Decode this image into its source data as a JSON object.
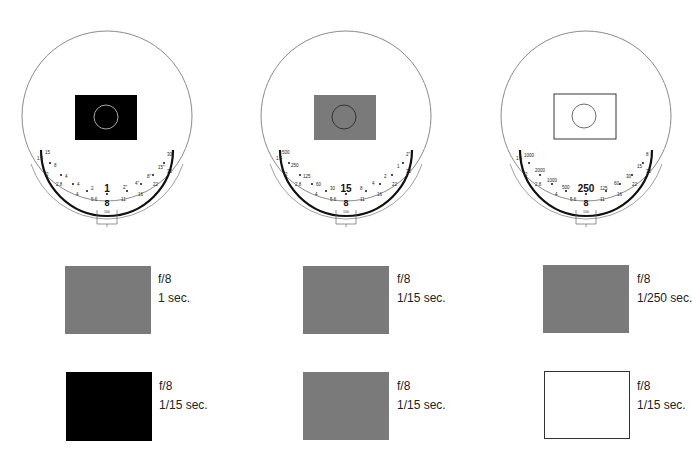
{
  "dials": [
    {
      "id": "dial-1",
      "center_box_fill": "#000000",
      "center_box_stroke": "#000000",
      "center_circle_stroke": "#cfcfcf",
      "shutter_value": "1",
      "aperture_value": "8",
      "iso_value": "100",
      "outer_scale": [
        "15",
        "8",
        "4",
        "2",
        "1",
        "2\"",
        "4\"",
        "8\"",
        "15\"",
        "30\""
      ],
      "inner_scale": [
        "1.4",
        "2",
        "2.8",
        "4",
        "5.6",
        "11",
        "16",
        "22",
        "32"
      ]
    },
    {
      "id": "dial-2",
      "center_box_fill": "#7a7a7a",
      "center_box_stroke": "#7a7a7a",
      "center_circle_stroke": "#222222",
      "shutter_value": "15",
      "aperture_value": "8",
      "iso_value": "100",
      "outer_scale": [
        "500",
        "250",
        "125",
        "60",
        "30",
        "15",
        "8",
        "4",
        "2",
        "1",
        "2\""
      ],
      "inner_scale": [
        "1.4",
        "2",
        "2.8",
        "4",
        "5.6",
        "11",
        "16",
        "22",
        "32"
      ]
    },
    {
      "id": "dial-3",
      "center_box_fill": "#ffffff",
      "center_box_stroke": "#222222",
      "center_circle_stroke": "#444444",
      "shutter_value": "250",
      "aperture_value": "8",
      "iso_value": "100",
      "outer_scale": [
        "1000",
        "2000",
        "1000",
        "500",
        "250",
        "125",
        "60",
        "30",
        "15",
        "8"
      ],
      "inner_scale": [
        "1.4",
        "2",
        "2.8",
        "4",
        "5.6",
        "11",
        "16",
        "22",
        "32"
      ]
    }
  ],
  "results": [
    {
      "row": 1,
      "col": 1,
      "fill": "#7a7a7a",
      "stroke": "#7a7a7a",
      "aperture": "f/8",
      "shutter": "1 sec."
    },
    {
      "row": 1,
      "col": 2,
      "fill": "#7a7a7a",
      "stroke": "#7a7a7a",
      "aperture": "f/8",
      "shutter": "1/15 sec."
    },
    {
      "row": 1,
      "col": 3,
      "fill": "#7a7a7a",
      "stroke": "#7a7a7a",
      "aperture": "f/8",
      "shutter": "1/250 sec."
    },
    {
      "row": 2,
      "col": 1,
      "fill": "#000000",
      "stroke": "#000000",
      "aperture": "f/8",
      "shutter": "1/15 sec."
    },
    {
      "row": 2,
      "col": 2,
      "fill": "#7a7a7a",
      "stroke": "#7a7a7a",
      "aperture": "f/8",
      "shutter": "1/15 sec."
    },
    {
      "row": 2,
      "col": 3,
      "fill": "#ffffff",
      "stroke": "#333333",
      "aperture": "f/8",
      "shutter": "1/15 sec."
    }
  ]
}
